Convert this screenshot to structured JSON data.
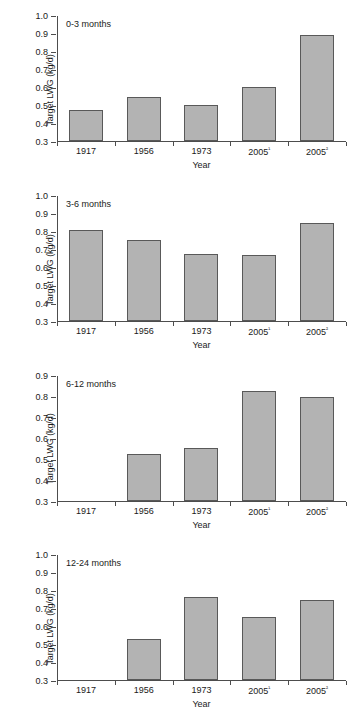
{
  "figure": {
    "ylabel": "Target LWG (kg/d)",
    "xlabel": "Year",
    "bar_color": "#b3b3b3",
    "bar_border_color": "#595959",
    "axis_color": "#4d4d4d"
  },
  "chart_data": [
    {
      "type": "bar",
      "title": "0-3 months",
      "categories": [
        "1917",
        "1956",
        "1973",
        "2005¹",
        "2005²"
      ],
      "values": [
        0.475,
        0.545,
        0.5,
        0.6,
        0.895
      ],
      "xlabel": "Year",
      "ylabel": "Target LWG (kg/d)",
      "ylim": [
        0.3,
        1.0
      ],
      "ytick_values": [
        0.3,
        0.4,
        0.5,
        0.6,
        0.7,
        0.8,
        0.9,
        1.0
      ],
      "ytick_labels": [
        "0.3",
        "0.4",
        "0.5",
        "0.6",
        "0.7",
        "0.8",
        "0.9",
        "1.0"
      ],
      "grid": false,
      "legend": false
    },
    {
      "type": "bar",
      "title": "3-6 months",
      "categories": [
        "1917",
        "1956",
        "1973",
        "2005¹",
        "2005²"
      ],
      "values": [
        0.81,
        0.75,
        0.673,
        0.671,
        0.848
      ],
      "xlabel": "Year",
      "ylabel": "Target LWG (kg/d)",
      "ylim": [
        0.3,
        1.0
      ],
      "ytick_values": [
        0.3,
        0.4,
        0.5,
        0.6,
        0.7,
        0.8,
        0.9,
        1.0
      ],
      "ytick_labels": [
        "0.3",
        "0.4",
        "0.5",
        "0.6",
        "0.7",
        "0.8",
        "0.9",
        "1.0"
      ],
      "grid": false,
      "legend": false
    },
    {
      "type": "bar",
      "title": "6-12 months",
      "categories": [
        "1917",
        "1956",
        "1973",
        "2005¹",
        "2005²"
      ],
      "values": [
        null,
        0.523,
        0.551,
        0.826,
        0.799
      ],
      "xlabel": "Year",
      "ylabel": "Target LWG (kg/d)",
      "ylim": [
        0.3,
        0.9
      ],
      "ytick_values": [
        0.3,
        0.4,
        0.5,
        0.6,
        0.7,
        0.8,
        0.9
      ],
      "ytick_labels": [
        "0.3",
        "0.4",
        "0.5",
        "0.6",
        "0.7",
        "0.8",
        "0.9"
      ],
      "grid": false,
      "legend": false
    },
    {
      "type": "bar",
      "title": "12-24 months",
      "categories": [
        "1917",
        "1956",
        "1973",
        "2005¹",
        "2005²"
      ],
      "values": [
        null,
        0.531,
        0.768,
        0.657,
        0.748
      ],
      "xlabel": "Year",
      "ylabel": "Target LWG (kg/d)",
      "ylim": [
        0.3,
        1.0
      ],
      "ytick_values": [
        0.3,
        0.4,
        0.5,
        0.6,
        0.7,
        0.8,
        0.9,
        1.0
      ],
      "ytick_labels": [
        "0.3",
        "0.4",
        "0.5",
        "0.6",
        "0.7",
        "0.8",
        "0.9",
        "1.0"
      ],
      "grid": false,
      "legend": false
    }
  ]
}
